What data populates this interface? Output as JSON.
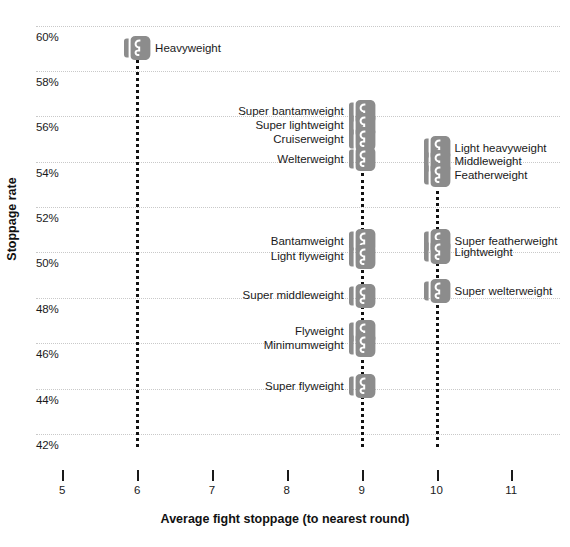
{
  "chart_data": {
    "type": "scatter",
    "title": "",
    "xlabel": "Average fight stoppage (to nearest round)",
    "ylabel": "Stoppage rate",
    "xlim": [
      4.65,
      11.65
    ],
    "ylim": [
      41.2,
      60.6
    ],
    "grid": true,
    "legend": "none",
    "marker_icon": "boxing-glove-icon",
    "marker_color": "#8c8c8c",
    "xticks": [
      "5",
      "6",
      "7",
      "8",
      "9",
      "10",
      "11"
    ],
    "xtick_values": [
      5,
      6,
      7,
      8,
      9,
      10,
      11
    ],
    "yticks": [
      "60%",
      "58%",
      "56%",
      "54%",
      "52%",
      "50%",
      "48%",
      "46%",
      "44%",
      "42%"
    ],
    "ytick_values": [
      60,
      58,
      56,
      54,
      52,
      50,
      48,
      46,
      44,
      42
    ],
    "points": [
      {
        "label": "Heavyweight",
        "x": 6,
        "y": 59.0,
        "label_side": "right"
      },
      {
        "label": "Super bantamweight",
        "x": 9,
        "y": 56.2,
        "label_side": "left"
      },
      {
        "label": "Super lightweight",
        "x": 9,
        "y": 55.6,
        "label_side": "left"
      },
      {
        "label": "Cruiserweight",
        "x": 9,
        "y": 55.0,
        "label_side": "left"
      },
      {
        "label": "Welterweight",
        "x": 9,
        "y": 54.1,
        "label_side": "left"
      },
      {
        "label": "Light heavyweight",
        "x": 10,
        "y": 54.6,
        "label_side": "right"
      },
      {
        "label": "Middleweight",
        "x": 10,
        "y": 54.0,
        "label_side": "right"
      },
      {
        "label": "Featherweight",
        "x": 10,
        "y": 53.4,
        "label_side": "right"
      },
      {
        "label": "Bantamweight",
        "x": 9,
        "y": 50.5,
        "label_side": "left"
      },
      {
        "label": "Light flyweight",
        "x": 9,
        "y": 49.8,
        "label_side": "left"
      },
      {
        "label": "Super featherweight",
        "x": 10,
        "y": 50.5,
        "label_side": "right"
      },
      {
        "label": "Lightweight",
        "x": 10,
        "y": 50.0,
        "label_side": "right"
      },
      {
        "label": "Super middleweight",
        "x": 9,
        "y": 48.1,
        "label_side": "left"
      },
      {
        "label": "Super welterweight",
        "x": 10,
        "y": 48.3,
        "label_side": "right"
      },
      {
        "label": "Flyweight",
        "x": 9,
        "y": 46.5,
        "label_side": "left"
      },
      {
        "label": "Minimumweight",
        "x": 9,
        "y": 45.9,
        "label_side": "left"
      },
      {
        "label": "Super flyweight",
        "x": 9,
        "y": 44.1,
        "label_side": "left"
      }
    ],
    "stems": [
      {
        "x": 6,
        "y_top": 58.7,
        "y_bottom": 41.4
      },
      {
        "x": 9,
        "y_top": 53.5,
        "y_bottom": 41.4
      },
      {
        "x": 10,
        "y_top": 53.0,
        "y_bottom": 41.4
      }
    ]
  }
}
